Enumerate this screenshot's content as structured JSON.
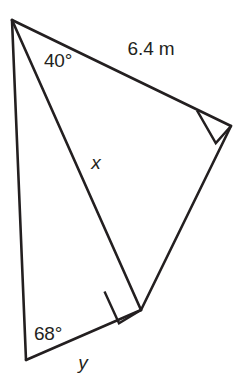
{
  "figure": {
    "kind": "two-triangle-geometry-diagram",
    "background_color": "#ffffff",
    "stroke_color": "#231f20",
    "width": 239,
    "height": 384,
    "vertices": {
      "apex_top_left": {
        "x": 12,
        "y": 20
      },
      "bottom_left": {
        "x": 26,
        "y": 360
      },
      "bottom_middle_right_angle": {
        "x": 141,
        "y": 310
      },
      "right_right_angle": {
        "x": 231,
        "y": 126
      }
    },
    "segments": [
      {
        "name": "top-hypotenuse",
        "from": "apex_top_left",
        "to": "right_right_angle",
        "label": "6.4 m"
      },
      {
        "name": "left-side",
        "from": "apex_top_left",
        "to": "bottom_left",
        "label": ""
      },
      {
        "name": "shared-diagonal",
        "from": "apex_top_left",
        "to": "bottom_middle_right_angle",
        "label": "x"
      },
      {
        "name": "bottom-side",
        "from": "bottom_left",
        "to": "bottom_middle_right_angle",
        "label": "y"
      },
      {
        "name": "right-side",
        "from": "bottom_middle_right_angle",
        "to": "right_right_angle",
        "label": ""
      }
    ],
    "right_angle_marks": [
      {
        "name": "right-angle-at-right-vertex",
        "at": "right_right_angle"
      },
      {
        "name": "right-angle-at-bottom-middle-vertex",
        "at": "bottom_middle_right_angle"
      }
    ]
  },
  "labels": {
    "angle_top": {
      "text": "40°",
      "x": 58,
      "y": 60
    },
    "side_top": {
      "text": "6.4 m",
      "x": 151,
      "y": 48
    },
    "side_diagonal": {
      "text": "x",
      "x": 96,
      "y": 162
    },
    "angle_bottom": {
      "text": "68°",
      "x": 48,
      "y": 333
    },
    "side_bottom": {
      "text": "y",
      "x": 83,
      "y": 362
    }
  }
}
